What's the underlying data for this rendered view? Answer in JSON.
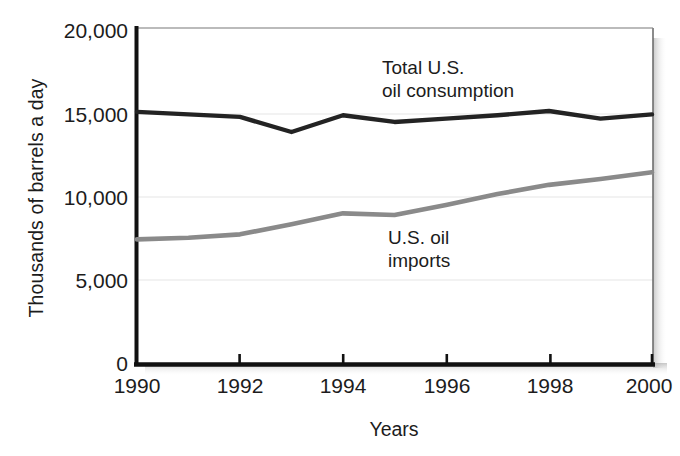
{
  "chart_data": {
    "type": "line",
    "title": "",
    "xlabel": "Years",
    "ylabel": "Thousands of barrels a day",
    "x": [
      1990,
      1991,
      1992,
      1993,
      1994,
      1995,
      1996,
      1997,
      1998,
      1999,
      2000
    ],
    "xlim": [
      1990,
      2000
    ],
    "ylim": [
      0,
      20000
    ],
    "xticks": [
      1990,
      1992,
      1994,
      1996,
      1998,
      2000
    ],
    "xticklabels": [
      "1990",
      "1992",
      "1994",
      "1996",
      "1998",
      "2000"
    ],
    "yticks": [
      0,
      5000,
      10000,
      15000,
      20000
    ],
    "yticklabels": [
      "0",
      "5,000",
      "10,000",
      "15,000",
      "20,000"
    ],
    "grid": true,
    "legend": "annotations-inline",
    "series": [
      {
        "name": "Total U.S. oil consumption",
        "color": "#232323",
        "values": [
          15000,
          14850,
          14700,
          13800,
          14800,
          14400,
          14600,
          14800,
          15050,
          14600,
          14850
        ]
      },
      {
        "name": "U.S. oil imports",
        "color": "#8a8a8a",
        "values": [
          7400,
          7500,
          7700,
          8300,
          8950,
          8850,
          9450,
          10100,
          10650,
          11000,
          11400
        ]
      }
    ],
    "annotations": [
      {
        "id": "consumption",
        "text": "Total U.S.\noil consumption"
      },
      {
        "id": "imports",
        "text": "U.S. oil\nimports"
      }
    ]
  },
  "axes": {
    "y_title": "Thousands of barrels a day",
    "x_title": "Years",
    "y_labels": [
      "20,000",
      "15,000",
      "10,000",
      "5,000",
      "0"
    ],
    "x_labels": [
      "1990",
      "1992",
      "1994",
      "1996",
      "1998",
      "2000"
    ]
  },
  "annotations": {
    "consumption_label": "Total U.S.\noil consumption",
    "imports_label": "U.S. oil\nimports"
  },
  "colors": {
    "consumption_line": "#232323",
    "imports_line": "#8a8a8a",
    "axis": "#111111",
    "grid": "#e2e2e2",
    "background": "#ffffff"
  }
}
